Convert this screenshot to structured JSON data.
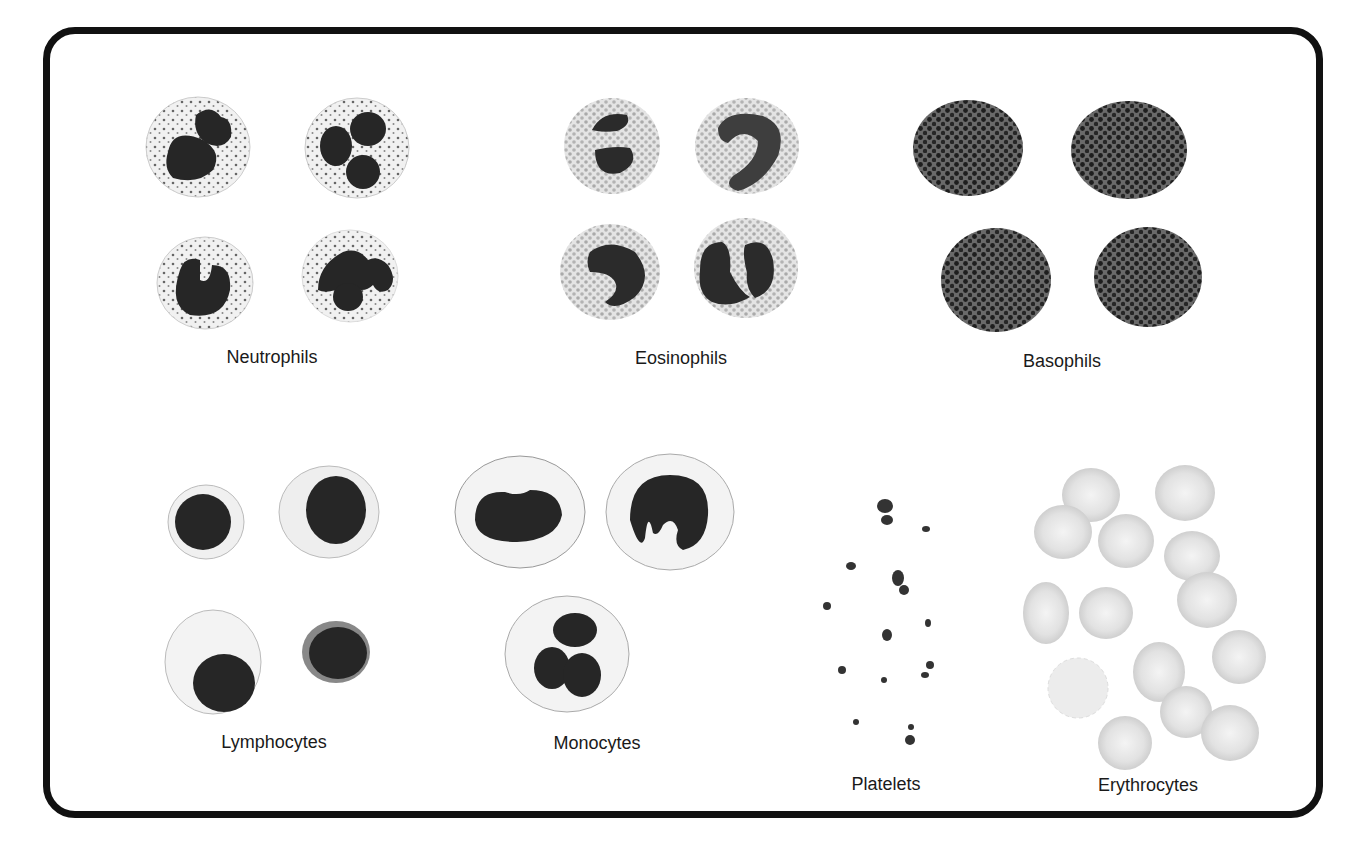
{
  "figure": {
    "title_fragment": "",
    "groups": [
      {
        "id": "neutrophils",
        "label": "Neutrophils",
        "count": 4
      },
      {
        "id": "eosinophils",
        "label": "Eosinophils",
        "count": 4
      },
      {
        "id": "basophils",
        "label": "Basophils",
        "count": 4
      },
      {
        "id": "lymphocytes",
        "label": "Lymphocytes",
        "count": 4
      },
      {
        "id": "monocytes",
        "label": "Monocytes",
        "count": 3
      },
      {
        "id": "platelets",
        "label": "Platelets",
        "count": 14
      },
      {
        "id": "erythrocytes",
        "label": "Erythrocytes",
        "count": 14
      }
    ]
  },
  "colors": {
    "border": "#111111",
    "nucleus": "#2a2a2a",
    "cytoplasm": "#ededed",
    "granule": "#777777",
    "eos_granule": "#9a9a9a",
    "rbc": "#e2e2e2"
  }
}
